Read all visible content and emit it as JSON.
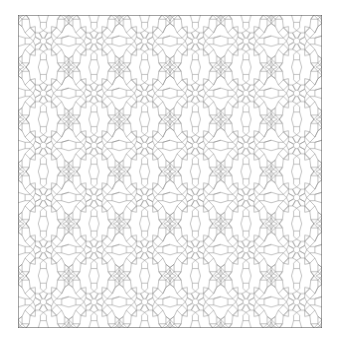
{
  "figure": {
    "type": "geometric-tiling",
    "motif": "eight-fold-rosette-with-four-point-stars",
    "columns": 6,
    "rows": 6,
    "background": "#ffffff",
    "stroke": "#7a7a7a",
    "border": "#6a6a6a"
  }
}
